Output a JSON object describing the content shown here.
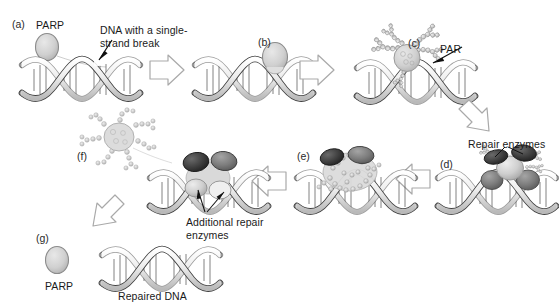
{
  "figure": {
    "background": "#ffffff",
    "width": 559,
    "height": 308
  },
  "colors": {
    "protein_light": "#d2d2d2",
    "protein_outline": "#6e6e6e",
    "enzyme_dark": "#3b3b3b",
    "enzyme_mid": "#7a7a7a",
    "enzyme_light": "#c4c4c4",
    "dna_ribbon": "#e8e8e8",
    "dna_outline": "#4a4a4a",
    "arrow_fill": "#ffffff",
    "arrow_outline": "#a8a8a8",
    "text": "#1a1a1a",
    "par_bead": "#cfcfcf"
  },
  "panels": [
    {
      "id": "a",
      "label": "(a)",
      "x": 12,
      "y": 18
    },
    {
      "id": "b",
      "label": "(b)",
      "x": 258,
      "y": 36
    },
    {
      "id": "c",
      "label": "(c)",
      "x": 408,
      "y": 37
    },
    {
      "id": "d",
      "label": "(d)",
      "x": 440,
      "y": 158
    },
    {
      "id": "e",
      "label": "(e)",
      "x": 297,
      "y": 150
    },
    {
      "id": "f",
      "label": "(f)",
      "x": 77,
      "y": 150
    },
    {
      "id": "g",
      "label": "(g)",
      "x": 36,
      "y": 232
    }
  ],
  "annotations": [
    {
      "name": "parp-label-top",
      "text": "PARP",
      "x": 36,
      "y": 19
    },
    {
      "name": "ssb-label",
      "text": "DNA with a single-\nstrand break",
      "x": 100,
      "y": 24
    },
    {
      "name": "par-label",
      "text": "PAR",
      "x": 440,
      "y": 43
    },
    {
      "name": "repair-enzymes",
      "text": "Repair enzymes",
      "x": 468,
      "y": 138
    },
    {
      "name": "additional-repair",
      "text": "Additional repair\nenzymes",
      "x": 186,
      "y": 216
    },
    {
      "name": "parp-label-bottom",
      "text": "PARP",
      "x": 45,
      "y": 280
    },
    {
      "name": "repaired-dna",
      "text": "Repaired DNA",
      "x": 118,
      "y": 290
    }
  ],
  "arrows": [
    {
      "name": "arrow-a-to-b",
      "direction": "right",
      "x": 150,
      "y": 68
    },
    {
      "name": "arrow-b-to-c",
      "direction": "right",
      "x": 300,
      "y": 68
    },
    {
      "name": "arrow-c-to-d",
      "direction": "down-right",
      "x": 452,
      "y": 100
    },
    {
      "name": "arrow-d-to-e",
      "direction": "left",
      "x": 398,
      "y": 178
    },
    {
      "name": "arrow-e-to-f",
      "direction": "left",
      "x": 248,
      "y": 180
    },
    {
      "name": "arrow-f-to-g",
      "direction": "down-left",
      "x": 82,
      "y": 206
    }
  ],
  "steps": [
    {
      "panel": "a",
      "description": "PARP protein free in solution near DNA with a single-strand break"
    },
    {
      "panel": "b",
      "description": "PARP binds to the DNA single-strand break site"
    },
    {
      "panel": "c",
      "description": "PARP synthesizes poly(ADP-ribose) (PAR) chains"
    },
    {
      "panel": "d",
      "description": "Repair enzymes are recruited to the PAR-marked break"
    },
    {
      "panel": "e",
      "description": "Repair enzyme complex assembles on the damaged DNA"
    },
    {
      "panel": "f",
      "description": "PARP with PAR chains is released from the DNA; additional repair enzymes complete repair"
    },
    {
      "panel": "g",
      "description": "Repaired DNA and free PARP"
    }
  ]
}
